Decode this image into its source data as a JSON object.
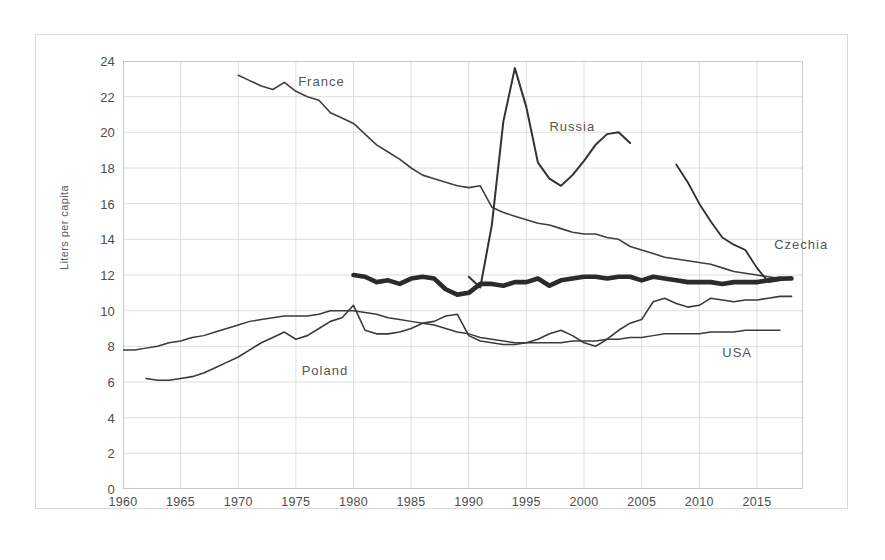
{
  "chart_data": {
    "type": "line",
    "title": "",
    "xlabel": "",
    "ylabel": "Liters per capita",
    "xlim": [
      1960,
      2019
    ],
    "ylim": [
      0,
      24
    ],
    "ytick_values": [
      0,
      2,
      4,
      6,
      8,
      10,
      12,
      14,
      16,
      18,
      20,
      22,
      24
    ],
    "ytick_labels": [
      "0",
      "2",
      "4",
      "6",
      "8",
      "10",
      "12",
      "14",
      "16",
      "18",
      "20",
      "22",
      "24"
    ],
    "xtick_values": [
      1960,
      1965,
      1970,
      1975,
      1980,
      1985,
      1990,
      1995,
      2000,
      2005,
      2010,
      2015
    ],
    "xtick_labels": [
      "1960",
      "1965",
      "1970",
      "1975",
      "1980",
      "1985",
      "1990",
      "1995",
      "2000",
      "2005",
      "2010",
      "2015"
    ],
    "grid": true,
    "grid_color": "#d6d6d6",
    "legend": "inline-annotations",
    "series": [
      {
        "name": "France",
        "color": "#3f3f3f",
        "width": 1.6,
        "label_x": 1975.2,
        "label_y": 22.8,
        "x": [
          1970,
          1971,
          1972,
          1973,
          1974,
          1975,
          1976,
          1977,
          1978,
          1979,
          1980,
          1981,
          1982,
          1983,
          1984,
          1985,
          1986,
          1987,
          1988,
          1989,
          1990,
          1991,
          1992,
          1993,
          1994,
          1995,
          1996,
          1997,
          1998,
          1999,
          2000,
          2001,
          2002,
          2003,
          2004,
          2005,
          2006,
          2007,
          2008,
          2009,
          2010,
          2011,
          2012,
          2013,
          2014,
          2015,
          2016,
          2017,
          2018
        ],
        "y": [
          23.2,
          22.9,
          22.6,
          22.4,
          22.8,
          22.3,
          22.0,
          21.8,
          21.1,
          20.8,
          20.5,
          19.9,
          19.3,
          18.9,
          18.5,
          18.0,
          17.6,
          17.4,
          17.2,
          17.0,
          16.9,
          17.0,
          15.8,
          15.5,
          15.3,
          15.1,
          14.9,
          14.8,
          14.6,
          14.4,
          14.3,
          14.3,
          14.1,
          14.0,
          13.6,
          13.4,
          13.2,
          13.0,
          12.9,
          12.8,
          12.7,
          12.6,
          12.4,
          12.2,
          12.1,
          12.0,
          11.9,
          11.8,
          11.9
        ]
      },
      {
        "name": "Russia",
        "color": "#333333",
        "width": 2.0,
        "label_x": 1997.0,
        "label_y": 20.3,
        "x": [
          1990,
          1991,
          1992,
          1993,
          1994,
          1995,
          1996,
          1997,
          1998,
          1999,
          2000,
          2001,
          2002,
          2003,
          2004
        ],
        "y": [
          11.9,
          11.3,
          14.8,
          20.6,
          23.6,
          21.4,
          18.3,
          17.4,
          17.0,
          17.6,
          18.4,
          19.3,
          19.9,
          20.0,
          19.4
        ]
      },
      {
        "name": "Czechia",
        "color": "#2e2e2e",
        "width": 1.8,
        "label_x": 2016.5,
        "label_y": 13.7,
        "x": [
          2008,
          2009,
          2010,
          2011,
          2012,
          2013,
          2014,
          2015,
          2016,
          2017,
          2018
        ],
        "y": [
          18.2,
          17.2,
          16.0,
          15.0,
          14.1,
          13.7,
          13.4,
          12.4,
          11.6,
          11.7,
          11.8
        ]
      },
      {
        "name": "Czechia-bold",
        "color": "#2b2b2b",
        "width": 4.6,
        "label_x": null,
        "label_y": null,
        "x": [
          1980,
          1981,
          1982,
          1983,
          1984,
          1985,
          1986,
          1987,
          1988,
          1989,
          1990,
          1991,
          1992,
          1993,
          1994,
          1995,
          1996,
          1997,
          1998,
          1999,
          2000,
          2001,
          2002,
          2003,
          2004,
          2005,
          2006,
          2007,
          2008,
          2009,
          2010,
          2011,
          2012,
          2013,
          2014,
          2015,
          2016,
          2017,
          2018
        ],
        "y": [
          12.0,
          11.9,
          11.6,
          11.7,
          11.5,
          11.8,
          11.9,
          11.8,
          11.2,
          10.9,
          11.0,
          11.5,
          11.5,
          11.4,
          11.6,
          11.6,
          11.8,
          11.4,
          11.7,
          11.8,
          11.9,
          11.9,
          11.8,
          11.9,
          11.9,
          11.7,
          11.9,
          11.8,
          11.7,
          11.6,
          11.6,
          11.6,
          11.5,
          11.6,
          11.6,
          11.6,
          11.7,
          11.8,
          11.8
        ]
      },
      {
        "name": "Poland",
        "color": "#3a3a3a",
        "width": 1.6,
        "label_x": 1975.5,
        "label_y": 6.6,
        "x": [
          1962,
          1963,
          1964,
          1965,
          1966,
          1967,
          1968,
          1969,
          1970,
          1971,
          1972,
          1973,
          1974,
          1975,
          1976,
          1977,
          1978,
          1979,
          1980,
          1981,
          1982,
          1983,
          1984,
          1985,
          1986,
          1987,
          1988,
          1989,
          1990,
          1991,
          1992,
          1993,
          1994,
          1995,
          1996,
          1997,
          1998,
          1999,
          2000,
          2001,
          2002,
          2003,
          2004,
          2005,
          2006,
          2007,
          2008,
          2009,
          2010,
          2011,
          2012,
          2013,
          2014,
          2015,
          2016,
          2017,
          2018
        ],
        "y": [
          6.2,
          6.1,
          6.1,
          6.2,
          6.3,
          6.5,
          6.8,
          7.1,
          7.4,
          7.8,
          8.2,
          8.5,
          8.8,
          8.4,
          8.6,
          9.0,
          9.4,
          9.6,
          10.3,
          8.9,
          8.7,
          8.7,
          8.8,
          9.0,
          9.3,
          9.4,
          9.7,
          9.8,
          8.6,
          8.3,
          8.2,
          8.1,
          8.1,
          8.2,
          8.4,
          8.7,
          8.9,
          8.6,
          8.2,
          8.0,
          8.4,
          8.9,
          9.3,
          9.5,
          10.5,
          10.7,
          10.4,
          10.2,
          10.3,
          10.7,
          10.6,
          10.5,
          10.6,
          10.6,
          10.7,
          10.8,
          10.8
        ]
      },
      {
        "name": "USA",
        "color": "#3a3a3a",
        "width": 1.5,
        "label_x": 2012.0,
        "label_y": 7.6,
        "x": [
          1960,
          1961,
          1962,
          1963,
          1964,
          1965,
          1966,
          1967,
          1968,
          1969,
          1970,
          1971,
          1972,
          1973,
          1974,
          1975,
          1976,
          1977,
          1978,
          1979,
          1980,
          1981,
          1982,
          1983,
          1984,
          1985,
          1986,
          1987,
          1988,
          1989,
          1990,
          1991,
          1992,
          1993,
          1994,
          1995,
          1996,
          1997,
          1998,
          1999,
          2000,
          2001,
          2002,
          2003,
          2004,
          2005,
          2006,
          2007,
          2008,
          2009,
          2010,
          2011,
          2012,
          2013,
          2014,
          2015,
          2016,
          2017
        ],
        "y": [
          7.8,
          7.8,
          7.9,
          8.0,
          8.2,
          8.3,
          8.5,
          8.6,
          8.8,
          9.0,
          9.2,
          9.4,
          9.5,
          9.6,
          9.7,
          9.7,
          9.7,
          9.8,
          10.0,
          10.0,
          10.0,
          9.9,
          9.8,
          9.6,
          9.5,
          9.4,
          9.3,
          9.2,
          9.0,
          8.8,
          8.7,
          8.5,
          8.4,
          8.3,
          8.2,
          8.2,
          8.2,
          8.2,
          8.2,
          8.3,
          8.3,
          8.3,
          8.4,
          8.4,
          8.5,
          8.5,
          8.6,
          8.7,
          8.7,
          8.7,
          8.7,
          8.8,
          8.8,
          8.8,
          8.9,
          8.9,
          8.9,
          8.9
        ]
      }
    ]
  }
}
